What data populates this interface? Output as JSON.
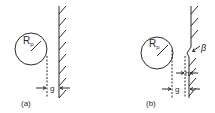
{
  "figure": {
    "panels": [
      {
        "label": "(a)",
        "radius_label": "R",
        "radius_subscript": "p",
        "gap_label": "g"
      },
      {
        "label": "(b)",
        "radius_label": "R",
        "radius_subscript": "p",
        "gap_label": "g",
        "step_label": "h",
        "angle_label": "β"
      }
    ],
    "colors": {
      "line": "#2a2a2a",
      "background": "#ffffff"
    }
  }
}
